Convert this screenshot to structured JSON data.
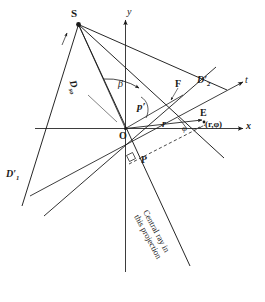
{
  "figure": {
    "type": "geometry-diagram",
    "background_color": "#ffffff",
    "stroke_color": "#1a1a1a"
  },
  "axes": {
    "x_label": "x",
    "y_label": "y",
    "t_label": "t"
  },
  "points": {
    "source": "S",
    "origin": "O",
    "point_E": "E",
    "point_E_coords": "(r,φ)",
    "point_F": "F",
    "point_P": "P",
    "detector_left": "D′",
    "detector_left_sub": "1",
    "detector_right": "D′",
    "detector_right_sub": "2"
  },
  "distances": {
    "d_so_base": "D",
    "d_so_sub": "so",
    "radial_r": "r",
    "p_prime": "p′"
  },
  "angles": {
    "beta": "β",
    "phi": "φ"
  },
  "annotations": {
    "central_ray_line1": "Central ray in",
    "central_ray_line2": "this projection"
  },
  "caption": {
    "partial_text": ""
  }
}
